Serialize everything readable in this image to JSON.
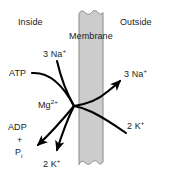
{
  "figure": {
    "width": 171,
    "height": 176,
    "background_color": "#ffffff",
    "membrane": {
      "label": "Membrane",
      "fill_color": "#cccccc",
      "edge_color": "#808080",
      "left_x": 79,
      "right_x": 103,
      "top_edge": "wavy",
      "bottom_edge": "wavy"
    },
    "compartments": {
      "left_label": "Inside",
      "right_label": "Outside"
    },
    "species": {
      "sodium_in": {
        "count": "3",
        "name": "Na",
        "charge": "+"
      },
      "sodium_out": {
        "count": "3",
        "name": "Na",
        "charge": "+"
      },
      "potassium_in": {
        "count": "2",
        "name": "K",
        "charge": "+"
      },
      "potassium_out": {
        "count": "2",
        "name": "K",
        "charge": "+"
      },
      "magnesium": {
        "name": "Mg",
        "charge": "2+"
      }
    },
    "energy": {
      "substrate": "ATP",
      "product_1": "ADP",
      "plus": "+",
      "product_2": {
        "name": "P",
        "subscript": "i"
      }
    },
    "line_color": "#000000"
  }
}
